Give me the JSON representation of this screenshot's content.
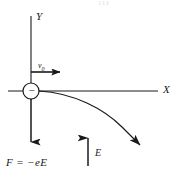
{
  "figure": {
    "title_artifact": "111",
    "background_color": "#ffffff",
    "stroke_color": "#1a1a1a",
    "axes": {
      "y_label": "Y",
      "x_label": "X",
      "origin": {
        "x": 31,
        "y": 91
      },
      "y_top": 16,
      "y_bottom": 100,
      "x_left": 8,
      "x_right": 158
    },
    "particle": {
      "name": "electron",
      "sign_label": "−",
      "center_x": 31,
      "center_y": 91,
      "radius": 8
    },
    "vectors": [
      {
        "id": "initial-velocity",
        "label": "v",
        "subscript": "0",
        "direction": "right",
        "from": {
          "x": 31,
          "y": 72
        },
        "to": {
          "x": 68,
          "y": 72
        }
      },
      {
        "id": "electric-force",
        "label": "F  = −eE",
        "direction": "down",
        "from": {
          "x": 31,
          "y": 99
        },
        "to": {
          "x": 31,
          "y": 151
        }
      },
      {
        "id": "electric-field",
        "label": "E",
        "direction": "up",
        "from": {
          "x": 88,
          "y": 166
        },
        "to": {
          "x": 88,
          "y": 127
        }
      },
      {
        "id": "trajectory",
        "label": "",
        "direction": "down-right",
        "from": {
          "x": 39,
          "y": 91
        },
        "to": {
          "x": 148,
          "y": 151
        }
      }
    ],
    "trajectory_path": "M 39 91 C 74 93 104 108 124 128 C 134 138 142 146 147 151",
    "labels": {
      "y_axis": "Y",
      "x_axis": "X",
      "initial_velocity": "v",
      "initial_velocity_sub": "0",
      "field": "E",
      "force_equation": "F  = −eE",
      "charge_sign": "−"
    }
  }
}
